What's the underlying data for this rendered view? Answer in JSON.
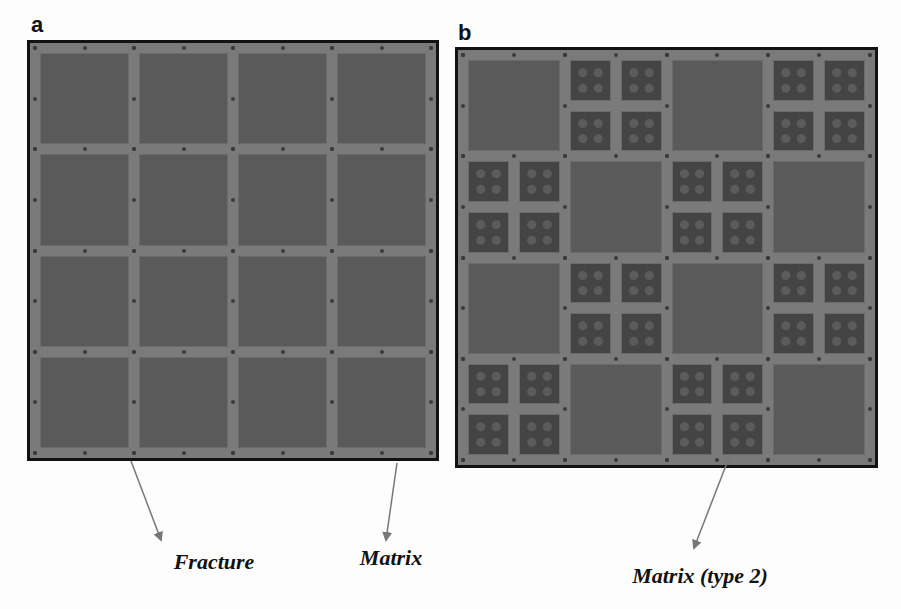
{
  "figure": {
    "panels": [
      {
        "label": "a",
        "description": "uniform fracture network: 4x4 grid of matrix blocks",
        "grid": {
          "rows": 4,
          "cols": 4,
          "cell_type": "matrix"
        }
      },
      {
        "label": "b",
        "description": "checkerboard of large matrix blocks and 2x2 subdivided matrix (type 2) blocks",
        "grid": {
          "rows": 4,
          "cols": 4,
          "pattern": [
            [
              "matrix",
              "type2",
              "matrix",
              "type2"
            ],
            [
              "type2",
              "matrix",
              "type2",
              "matrix"
            ],
            [
              "matrix",
              "type2",
              "matrix",
              "type2"
            ],
            [
              "type2",
              "matrix",
              "type2",
              "matrix"
            ]
          ]
        }
      }
    ],
    "annotations": [
      {
        "text": "Fracture",
        "target": "fracture"
      },
      {
        "text": "Matrix",
        "target": "matrix"
      },
      {
        "text": "Matrix (type 2)",
        "target": "matrix-type-2"
      }
    ],
    "colors": {
      "background": "#fdfdfd",
      "fracture": "#7a7a7a",
      "matrix": "#5a5a5a",
      "matrix_type2": "#444444",
      "border": "#121212",
      "arrow": "#777777"
    }
  }
}
